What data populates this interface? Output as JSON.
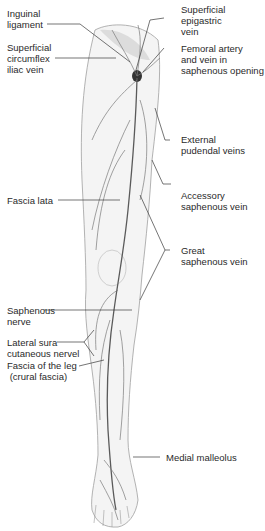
{
  "figure": {
    "labels_left": [
      {
        "id": "inguinal-ligament",
        "text": "Inguinal\nligament"
      },
      {
        "id": "superficial-circumflex-iliac-vein",
        "text": "Superficial\ncircumflex\niliac vein"
      },
      {
        "id": "fascia-lata",
        "text": "Fascia lata"
      },
      {
        "id": "saphenous-nerve",
        "text": "Saphenous\nnerve"
      },
      {
        "id": "lateral-sura-cutaneous-nerve",
        "text": "Lateral sura\ncutaneous nervel"
      },
      {
        "id": "fascia-of-the-leg",
        "text": "Fascia of the leg\n (crural fascia)"
      }
    ],
    "labels_right": [
      {
        "id": "superficial-epigastric-vein",
        "text": "Superficial\nepigastric\nvein"
      },
      {
        "id": "femoral-artery-and-vein",
        "text": "Femoral artery\nand vein in\nsaphenous opening"
      },
      {
        "id": "external-pudendal-veins",
        "text": "External\npudendal veins"
      },
      {
        "id": "accessory-saphenous-vein",
        "text": "Accessory\nsaphenous vein"
      },
      {
        "id": "great-saphenous-vein",
        "text": "Great\nsaphenous vein"
      },
      {
        "id": "medial-malleolus",
        "text": "Medial malleolus"
      }
    ]
  },
  "colors": {
    "line": "#3a3a3a",
    "vein": "#6a6a6a",
    "skin": "#f2f2f2",
    "outline": "#9a9a9a"
  }
}
